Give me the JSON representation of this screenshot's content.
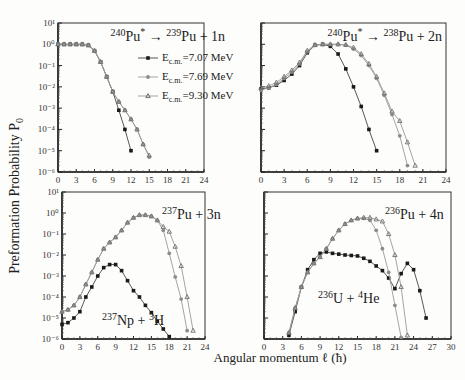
{
  "figure": {
    "ylabel": "Preformation Probability P",
    "ylabel_sub": "0",
    "xlabel": "Angular momentum ℓ (ħ)",
    "colors": {
      "series_707": "#1a1a1a",
      "series_769": "#8a8a8a",
      "series_930": "#6a6a6a",
      "line": "#999999",
      "axis": "#333333"
    }
  },
  "chart_data": [
    {
      "type": "line",
      "panel": "top-left",
      "title": "240Pu* → 239Pu + 1n",
      "title_parts": {
        "pre_sup": "240",
        "pre": "Pu",
        "star": "*",
        "post_sup": "239",
        "post": "Pu + 1n"
      },
      "xlabel": "Angular momentum ℓ (ħ)",
      "ylabel": "Preformation Probability P0",
      "yscale": "log",
      "xlim": [
        0,
        24
      ],
      "ylim": [
        1e-06,
        10
      ],
      "xticks": [
        0,
        3,
        6,
        9,
        12,
        15,
        18,
        21,
        24
      ],
      "yticks": [
        "10^1",
        "10^0",
        "10^-1",
        "10^-2",
        "10^-3",
        "10^-4",
        "10^-5",
        "10^-6"
      ],
      "legend": [
        {
          "label": "E_c.m.=7.07 MeV",
          "marker": "square"
        },
        {
          "label": "E_c.m.=7.69 MeV",
          "marker": "circle"
        },
        {
          "label": "E_c.m.=9.30 MeV",
          "marker": "triangle"
        }
      ],
      "series": [
        {
          "name": "E_c.m.=7.07 MeV",
          "marker": "square",
          "x": [
            0,
            1,
            2,
            3,
            4,
            5,
            6,
            7,
            8,
            9,
            10,
            11,
            12
          ],
          "values": [
            1,
            1,
            1,
            1,
            1,
            0.9,
            0.5,
            0.15,
            0.03,
            0.006,
            0.0008,
            0.0001,
            1e-05
          ]
        },
        {
          "name": "E_c.m.=7.69 MeV",
          "marker": "circle",
          "x": [
            0,
            1,
            2,
            3,
            4,
            5,
            6,
            7,
            8,
            9,
            10,
            11,
            12,
            13,
            14,
            15
          ],
          "values": [
            1,
            1,
            1,
            1,
            1,
            0.9,
            0.5,
            0.15,
            0.03,
            0.006,
            0.002,
            0.0008,
            0.0003,
            0.0001,
            2e-05,
            5e-06
          ]
        },
        {
          "name": "E_c.m.=9.30 MeV",
          "marker": "triangle",
          "x": [
            0,
            1,
            2,
            3,
            4,
            5,
            6,
            7,
            8,
            9,
            10,
            11,
            12,
            13,
            14,
            15
          ],
          "values": [
            1,
            1,
            1,
            1,
            1,
            0.9,
            0.5,
            0.15,
            0.03,
            0.006,
            0.002,
            0.0008,
            0.0003,
            0.0001,
            2e-05,
            6e-06
          ]
        }
      ]
    },
    {
      "type": "line",
      "panel": "top-right",
      "title": "240Pu* → 238Pu + 2n",
      "title_parts": {
        "pre_sup": "240",
        "pre": "Pu",
        "star": "*",
        "post_sup": "238",
        "post": "Pu + 2n"
      },
      "yscale": "log",
      "xlim": [
        0,
        24
      ],
      "ylim": [
        1e-06,
        10
      ],
      "xticks": [
        0,
        3,
        6,
        9,
        12,
        15,
        18,
        21,
        24
      ],
      "series": [
        {
          "name": "E_c.m.=7.07 MeV",
          "marker": "square",
          "x": [
            0,
            1,
            2,
            3,
            4,
            5,
            6,
            7,
            8,
            9,
            10,
            11,
            12,
            13,
            14,
            15
          ],
          "values": [
            0.008,
            0.009,
            0.012,
            0.02,
            0.04,
            0.1,
            0.4,
            0.9,
            1.0,
            0.8,
            0.35,
            0.07,
            0.01,
            0.0012,
            0.0001,
            1e-05
          ]
        },
        {
          "name": "E_c.m.=7.69 MeV",
          "marker": "circle",
          "x": [
            0,
            1,
            2,
            3,
            4,
            5,
            6,
            7,
            8,
            9,
            10,
            11,
            12,
            13,
            14,
            15,
            16,
            17,
            18,
            19
          ],
          "values": [
            0.007,
            0.009,
            0.013,
            0.025,
            0.05,
            0.12,
            0.45,
            0.9,
            1.0,
            1.0,
            1.0,
            0.9,
            0.6,
            0.3,
            0.1,
            0.025,
            0.004,
            0.0005,
            5e-05,
            2e-06
          ]
        },
        {
          "name": "E_c.m.=9.30 MeV",
          "marker": "triangle",
          "x": [
            0,
            1,
            2,
            3,
            4,
            5,
            6,
            7,
            8,
            9,
            10,
            11,
            12,
            13,
            14,
            15,
            16,
            17,
            18,
            19,
            20
          ],
          "values": [
            0.009,
            0.011,
            0.016,
            0.03,
            0.06,
            0.14,
            0.5,
            0.95,
            1.0,
            1.0,
            1.0,
            0.95,
            0.7,
            0.35,
            0.12,
            0.03,
            0.005,
            0.0007,
            0.00025,
            2.5e-05,
            2e-06
          ]
        }
      ]
    },
    {
      "type": "line",
      "panel": "bottom-left",
      "title": "237Pu + 3n",
      "title_parts": {
        "sup": "237",
        "text": "Pu + 3n"
      },
      "annotation": {
        "sup1": "237",
        "t1": "Np + ",
        "sup2": "3",
        "t2": "H"
      },
      "yscale": "log",
      "xlim": [
        0,
        24
      ],
      "ylim": [
        1e-06,
        10
      ],
      "xticks": [
        0,
        3,
        6,
        9,
        12,
        15,
        18,
        21,
        24
      ],
      "yticks": [
        "10^1",
        "10^0",
        "10^-1",
        "10^-2",
        "10^-3",
        "10^-4",
        "10^-5",
        "10^-6"
      ],
      "series": [
        {
          "name": "237Np + 3H",
          "marker": "square",
          "x": [
            0,
            1,
            2,
            3,
            4,
            5,
            6,
            7,
            8,
            9,
            10,
            11,
            12,
            13,
            14,
            15,
            16,
            17,
            18
          ],
          "values": [
            5e-06,
            6e-06,
            1e-05,
            2e-05,
            0.0001,
            0.0003,
            0.001,
            0.0025,
            0.0035,
            0.0035,
            0.0018,
            0.0006,
            0.0002,
            0.0001,
            4e-05,
            1.8e-05,
            7e-06,
            3e-06,
            1.3e-06
          ]
        },
        {
          "name": "237Pu + 3n (7.69 MeV)",
          "marker": "circle",
          "x": [
            0,
            1,
            2,
            3,
            4,
            5,
            6,
            7,
            8,
            9,
            10,
            11,
            12,
            13,
            14,
            15,
            16,
            17,
            18,
            19,
            20,
            21
          ],
          "values": [
            2e-05,
            2.5e-05,
            4e-05,
            0.0001,
            0.0004,
            0.0015,
            0.006,
            0.02,
            0.04,
            0.07,
            0.15,
            0.35,
            0.6,
            0.8,
            0.8,
            0.7,
            0.45,
            0.15,
            0.012,
            0.0009,
            8e-05,
            2.5e-06
          ]
        },
        {
          "name": "237Pu + 3n (9.30 MeV)",
          "marker": "triangle",
          "x": [
            0,
            1,
            2,
            3,
            4,
            5,
            6,
            7,
            8,
            9,
            10,
            11,
            12,
            13,
            14,
            15,
            16,
            17,
            18,
            19,
            20,
            21,
            22
          ],
          "values": [
            2e-05,
            2.5e-05,
            4e-05,
            0.0001,
            0.0004,
            0.0015,
            0.006,
            0.02,
            0.04,
            0.07,
            0.15,
            0.35,
            0.6,
            0.8,
            0.8,
            0.7,
            0.45,
            0.22,
            0.13,
            0.025,
            0.003,
            0.0001,
            2.5e-06
          ]
        }
      ]
    },
    {
      "type": "line",
      "panel": "bottom-right",
      "title": "236Pu + 4n",
      "title_parts": {
        "sup": "236",
        "text": "Pu + 4n"
      },
      "annotation": {
        "sup1": "236",
        "t1": "U + ",
        "sup2": "4",
        "t2": "He"
      },
      "yscale": "log",
      "xlim": [
        0,
        30
      ],
      "ylim": [
        1e-06,
        10
      ],
      "xticks": [
        0,
        3,
        6,
        9,
        12,
        15,
        18,
        21,
        24,
        27,
        30
      ],
      "series": [
        {
          "name": "236U + 4He",
          "marker": "square",
          "x": [
            4,
            5,
            6,
            7,
            8,
            9,
            10,
            11,
            12,
            13,
            14,
            15,
            16,
            17,
            18,
            19,
            20,
            21,
            22,
            23,
            24,
            25,
            26
          ],
          "values": [
            1.5e-06,
            2e-05,
            0.0003,
            0.002,
            0.006,
            0.012,
            0.014,
            0.012,
            0.011,
            0.01,
            0.0095,
            0.009,
            0.007,
            0.005,
            0.003,
            0.0018,
            0.0008,
            0.00025,
            0.0013,
            0.004,
            0.002,
            0.0002,
            1e-05
          ]
        },
        {
          "name": "236Pu + 4n (7.69 MeV)",
          "marker": "circle",
          "x": [
            4,
            5,
            6,
            7,
            8,
            9,
            10,
            11,
            12,
            13,
            14,
            15,
            16,
            17,
            18,
            19,
            20,
            21,
            22
          ],
          "values": [
            2e-06,
            3e-05,
            0.0003,
            0.0015,
            0.004,
            0.008,
            0.02,
            0.06,
            0.15,
            0.3,
            0.45,
            0.55,
            0.55,
            0.45,
            0.15,
            0.02,
            0.0015,
            4e-05,
            1.2e-06
          ]
        },
        {
          "name": "236Pu + 4n (9.30 MeV)",
          "marker": "triangle",
          "x": [
            4,
            5,
            6,
            7,
            8,
            9,
            10,
            11,
            12,
            13,
            14,
            15,
            16,
            17,
            18,
            19,
            20,
            21,
            22,
            23
          ],
          "values": [
            2e-06,
            3e-05,
            0.0003,
            0.0015,
            0.004,
            0.008,
            0.02,
            0.06,
            0.15,
            0.3,
            0.45,
            0.55,
            0.6,
            0.6,
            0.5,
            0.4,
            0.1,
            0.01,
            0.0003,
            1.5e-06
          ]
        }
      ]
    }
  ]
}
